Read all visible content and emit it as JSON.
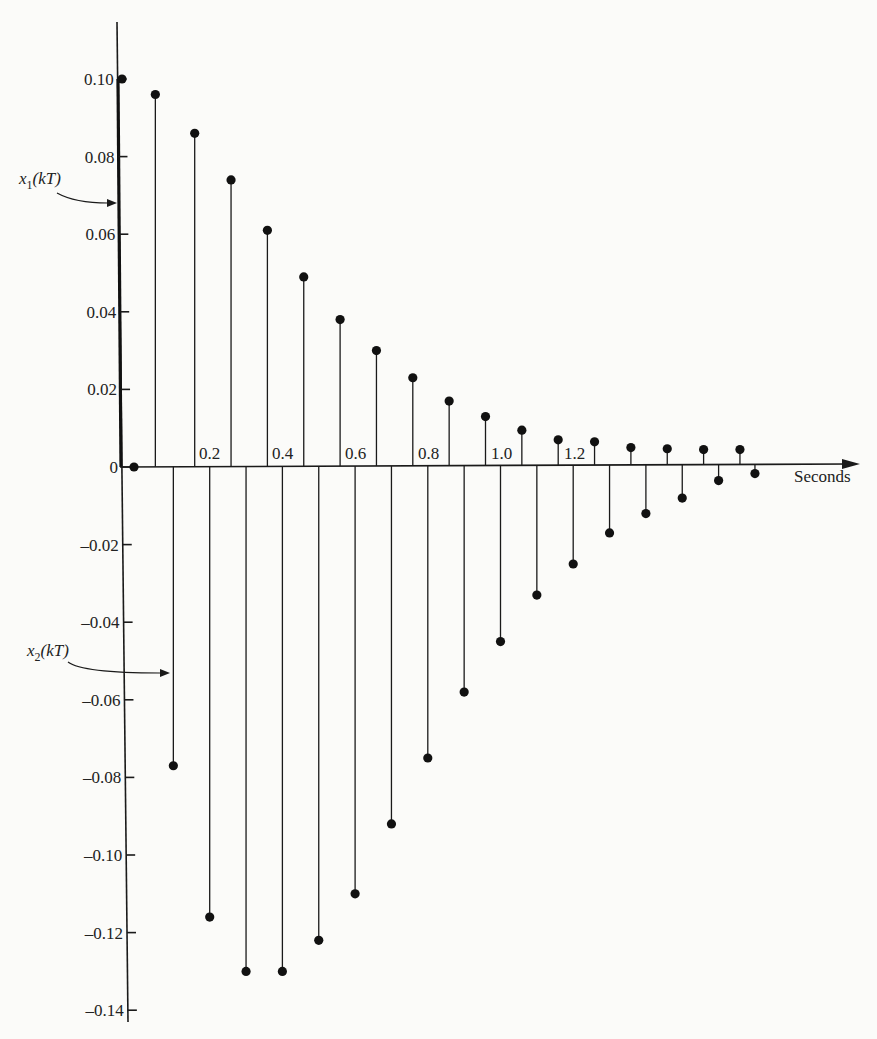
{
  "chart_data": {
    "type": "stem",
    "title": "",
    "xlabel": "Seconds",
    "ylabel": "",
    "xlim": [
      0,
      1.75
    ],
    "ylim": [
      -0.14,
      0.11
    ],
    "grid": false,
    "legend": "none (series annotated with arrows)",
    "x_tick_labels": [
      "0.2",
      "0.4",
      "0.6",
      "0.8",
      "1.0",
      "1.2"
    ],
    "y_tick_labels": [
      "0.10",
      "0.08",
      "0.06",
      "0.04",
      "0.02",
      "0",
      "-0.02",
      "-0.04",
      "-0.06",
      "-0.08",
      "-0.10",
      "-0.12",
      "-0.14"
    ],
    "sampling_period_T": 0.1,
    "series": [
      {
        "name": "x1(kT)",
        "x": [
          0.0,
          0.1,
          0.2,
          0.3,
          0.4,
          0.5,
          0.6,
          0.7,
          0.8,
          0.9,
          1.0,
          1.1,
          1.2,
          1.3,
          1.4,
          1.5,
          1.6,
          1.7
        ],
        "values": [
          0.1,
          0.096,
          0.086,
          0.074,
          0.061,
          0.049,
          0.038,
          0.03,
          0.023,
          0.017,
          0.013,
          0.0095,
          0.007,
          0.0065,
          0.005,
          0.0047,
          0.0045,
          0.0045
        ]
      },
      {
        "name": "x2(kT)",
        "x": [
          0.0,
          0.1,
          0.2,
          0.3,
          0.4,
          0.5,
          0.6,
          0.7,
          0.8,
          0.9,
          1.0,
          1.1,
          1.2,
          1.3,
          1.4,
          1.5,
          1.6,
          1.7
        ],
        "values": [
          0.0,
          -0.077,
          -0.116,
          -0.13,
          -0.13,
          -0.122,
          -0.11,
          -0.092,
          -0.075,
          -0.058,
          -0.045,
          -0.033,
          -0.025,
          -0.017,
          -0.012,
          -0.008,
          -0.0035,
          -0.0017
        ]
      }
    ],
    "annotations": [
      {
        "text": "x1(kT)",
        "points_to": "x1 stem at k=0 (y≈0.067)"
      },
      {
        "text": "x2(kT)",
        "points_to": "x2 stem at k=1 (y≈-0.055)"
      }
    ]
  },
  "labels": {
    "xlabel": "Seconds",
    "x1_annotation": {
      "base": "x",
      "sub": "1",
      "arg": "(kT)"
    },
    "x2_annotation": {
      "base": "x",
      "sub": "2",
      "arg": "(kT)"
    }
  }
}
